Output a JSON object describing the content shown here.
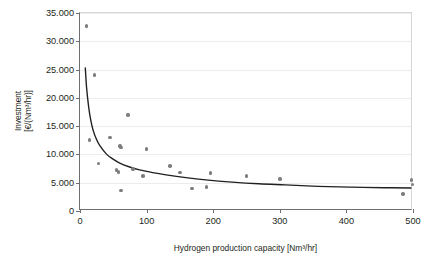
{
  "chart_data": {
    "type": "scatter",
    "title": "",
    "xlabel": "Hydrogen production capacity [Nm³/hr]",
    "ylabel_line1": "Investment",
    "ylabel_line2": "[€/(Nm³/hr)]",
    "xlim": [
      0,
      500
    ],
    "ylim": [
      0,
      35000
    ],
    "xticks": [
      0,
      100,
      200,
      300,
      400,
      500
    ],
    "xtick_labels": [
      "0",
      "100",
      "200",
      "300",
      "400",
      "500"
    ],
    "yticks": [
      0,
      5000,
      10000,
      15000,
      20000,
      25000,
      30000,
      35000
    ],
    "ytick_labels": [
      "0",
      "5.000",
      "10.000",
      "15.000",
      "20.000",
      "25.000",
      "30.000",
      "35.000"
    ],
    "grid": "horizontal",
    "legend": "none",
    "marker_color": "#7d7d80",
    "curve_color": "#231f20",
    "axis_color": "#6e6e71",
    "grid_color": "#ececee",
    "series": [
      {
        "name": "Investment data points",
        "type": "scatter",
        "points": [
          [
            10,
            32700
          ],
          [
            22,
            24000
          ],
          [
            14,
            12500
          ],
          [
            28,
            8400
          ],
          [
            45,
            13000
          ],
          [
            72,
            17000
          ],
          [
            60,
            11500
          ],
          [
            62,
            11200
          ],
          [
            55,
            7200
          ],
          [
            58,
            6900
          ],
          [
            62,
            3600
          ],
          [
            80,
            7400
          ],
          [
            100,
            11000
          ],
          [
            95,
            6200
          ],
          [
            135,
            8000
          ],
          [
            150,
            6800
          ],
          [
            168,
            4000
          ],
          [
            190,
            4200
          ],
          [
            196,
            6700
          ],
          [
            250,
            6200
          ],
          [
            300,
            5700
          ],
          [
            485,
            3000
          ],
          [
            498,
            5500
          ],
          [
            499,
            4700
          ]
        ]
      },
      {
        "name": "Fitted trend curve",
        "type": "line",
        "description": "Power-law decay fit",
        "points": [
          [
            8,
            25200
          ],
          [
            10,
            21600
          ],
          [
            13,
            18300
          ],
          [
            16,
            16000
          ],
          [
            20,
            14000
          ],
          [
            25,
            12400
          ],
          [
            30,
            11300
          ],
          [
            40,
            9800
          ],
          [
            50,
            8900
          ],
          [
            60,
            8200
          ],
          [
            75,
            7500
          ],
          [
            90,
            7000
          ],
          [
            110,
            6500
          ],
          [
            130,
            6100
          ],
          [
            160,
            5600
          ],
          [
            190,
            5200
          ],
          [
            230,
            4800
          ],
          [
            270,
            4500
          ],
          [
            310,
            4300
          ],
          [
            360,
            4050
          ],
          [
            410,
            3900
          ],
          [
            460,
            3800
          ],
          [
            500,
            3750
          ]
        ]
      }
    ]
  }
}
